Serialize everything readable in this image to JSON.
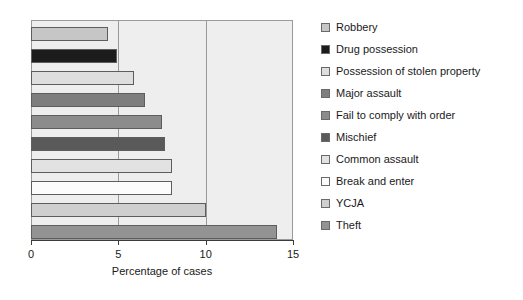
{
  "chart_data": {
    "type": "bar",
    "orientation": "horizontal",
    "title": "",
    "xlabel": "Percentage of cases",
    "ylabel": "",
    "xlim": [
      0,
      15
    ],
    "xticks": [
      0,
      5,
      10,
      15
    ],
    "xtick_labels": [
      "0",
      "5",
      "10",
      "15"
    ],
    "grid": true,
    "gridlines_at": [
      5,
      10
    ],
    "legend_position": "right",
    "categories": [
      "Robbery",
      "Drug possession",
      "Possession of stolen property",
      "Major assault",
      "Fail to comply with order",
      "Mischief",
      "Common assault",
      "Break and enter",
      "YCJA",
      "Theft"
    ],
    "values": [
      4.4,
      4.9,
      5.9,
      6.5,
      7.5,
      7.7,
      8.1,
      8.1,
      10.0,
      14.1
    ],
    "colors": [
      "#c6c6c6",
      "#1c1c1c",
      "#dedede",
      "#7e7e7e",
      "#8c8c8c",
      "#5a5a5a",
      "#e2e2e2",
      "#fcfcfc",
      "#cfcfcf",
      "#939393"
    ],
    "plot_background": "#eeeeee",
    "axis_color": "#3b3b3b",
    "bar_edge_color": "#5d5d5d"
  },
  "legend": {
    "items": [
      {
        "label": "Robbery",
        "swatch": "legend-swatch-robbery"
      },
      {
        "label": "Drug possession",
        "swatch": "legend-swatch-drug-possession"
      },
      {
        "label": "Possession of stolen property",
        "swatch": "legend-swatch-possession-of-stolen-property"
      },
      {
        "label": "Major assault",
        "swatch": "legend-swatch-major-assault"
      },
      {
        "label": "Fail to comply with order",
        "swatch": "legend-swatch-fail-to-comply-with-order"
      },
      {
        "label": "Mischief",
        "swatch": "legend-swatch-mischief"
      },
      {
        "label": "Common assault",
        "swatch": "legend-swatch-common-assault"
      },
      {
        "label": "Break and enter",
        "swatch": "legend-swatch-break-and-enter"
      },
      {
        "label": "YCJA",
        "swatch": "legend-swatch-ycja"
      },
      {
        "label": "Theft",
        "swatch": "legend-swatch-theft"
      }
    ]
  }
}
